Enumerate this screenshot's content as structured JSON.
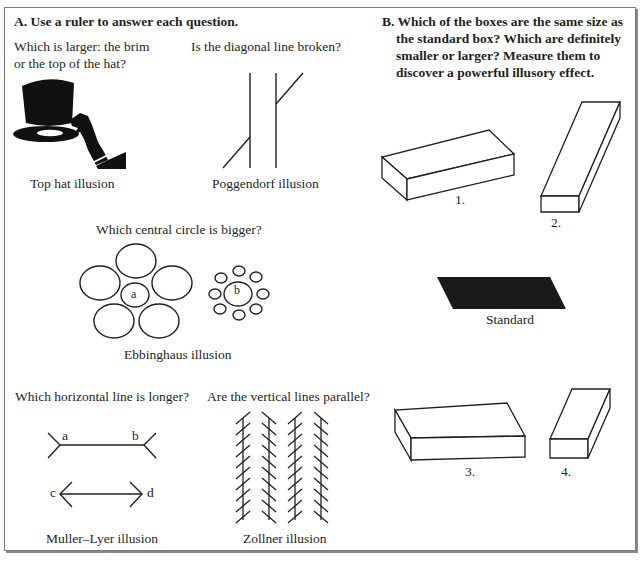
{
  "section_a": {
    "heading": "A. Use a ruler to answer each question.",
    "top_hat": {
      "question_line1": "Which is larger: the brim",
      "question_line2": "or the top of the hat?",
      "caption": "Top hat illusion"
    },
    "poggendorf": {
      "question": "Is the diagonal line broken?",
      "caption": "Poggendorf illusion"
    },
    "ebbinghaus": {
      "question": "Which central circle is bigger?",
      "label_a": "a",
      "label_b": "b",
      "caption": "Ebbinghaus illusion"
    },
    "muller_lyer": {
      "question": "Which horizontal line is longer?",
      "label_a": "a",
      "label_b": "b",
      "label_c": "c",
      "label_d": "d",
      "caption": "Muller–Lyer illusion"
    },
    "zollner": {
      "question": "Are the vertical lines parallel?",
      "caption": "Zollner illusion"
    }
  },
  "section_b": {
    "heading": "B. Which of the boxes are the same size as the standard box? Which are definitely smaller or larger? Measure them to discover a powerful illusory effect.",
    "boxes": [
      {
        "label": "1."
      },
      {
        "label": "2."
      },
      {
        "label": "Standard"
      },
      {
        "label": "3."
      },
      {
        "label": "4."
      }
    ]
  }
}
